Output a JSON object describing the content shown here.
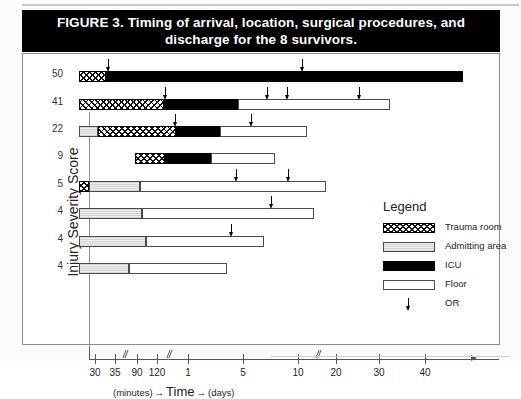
{
  "figure": {
    "title_line1": "FIGURE 3. Timing of arrival, location, surgical procedures, and",
    "title_line2": "discharge for the 8 survivors.",
    "ylabel": "Injury Severity Score",
    "xaxis_caption_minutes": "(minutes)",
    "xaxis_caption_time": "Time",
    "xaxis_caption_days": "(days)",
    "arrow_glyph": "→"
  },
  "legend": {
    "title": "Legend",
    "items": [
      {
        "label": "Trauma room",
        "kind": "trauma",
        "color": "#111111"
      },
      {
        "label": "Admitting area",
        "kind": "admit",
        "color": "#e3e3e3"
      },
      {
        "label": "ICU",
        "kind": "icu",
        "color": "#000000"
      },
      {
        "label": "Floor",
        "kind": "floor",
        "color": "#ffffff"
      },
      {
        "label": "OR",
        "kind": "arrow",
        "color": "#000000"
      }
    ]
  },
  "chart_data": {
    "type": "bar",
    "title": "FIGURE 3. Timing of arrival, location, surgical procedures, and discharge for the 8 survivors.",
    "xlabel": "Time (minutes → days)",
    "ylabel": "Injury Severity Score",
    "orientation": "horizontal-stacked-timeline",
    "grid": false,
    "legend_position": "right",
    "x_axis": {
      "units_left": "minutes",
      "units_right": "days",
      "break_marks": [
        true,
        true,
        true
      ],
      "ticks": [
        {
          "label": "30",
          "unit": "minutes",
          "px": 94
        },
        {
          "label": "35",
          "unit": "minutes",
          "px": 114
        },
        {
          "label": "90",
          "unit": "minutes",
          "px": 136
        },
        {
          "label": "120",
          "unit": "minutes",
          "px": 156
        },
        {
          "label": "1",
          "unit": "days",
          "px": 187
        },
        {
          "label": "5",
          "unit": "days",
          "px": 242
        },
        {
          "label": "10",
          "unit": "days",
          "px": 297
        },
        {
          "label": "20",
          "unit": "days",
          "px": 335
        },
        {
          "label": "30",
          "unit": "days",
          "px": 378
        },
        {
          "label": "40",
          "unit": "days",
          "px": 424
        }
      ]
    },
    "categories": [
      "50",
      "41",
      "22",
      "9",
      "5",
      "4",
      "4",
      "4"
    ],
    "patients": [
      {
        "iss": "50",
        "segments": [
          {
            "location": "Trauma room",
            "start_px": 78,
            "end_px": 105
          },
          {
            "location": "ICU",
            "start_px": 105,
            "end_px": 462
          }
        ],
        "or_marks_px": [
          107,
          301
        ]
      },
      {
        "iss": "41",
        "segments": [
          {
            "location": "Trauma room",
            "start_px": 78,
            "end_px": 163
          },
          {
            "location": "ICU",
            "start_px": 163,
            "end_px": 237
          },
          {
            "location": "Floor",
            "start_px": 237,
            "end_px": 389
          }
        ],
        "or_marks_px": [
          164,
          266,
          286,
          358
        ]
      },
      {
        "iss": "22",
        "segments": [
          {
            "location": "Admitting area",
            "start_px": 78,
            "end_px": 97
          },
          {
            "location": "Trauma room",
            "start_px": 97,
            "end_px": 175
          },
          {
            "location": "ICU",
            "start_px": 175,
            "end_px": 219
          },
          {
            "location": "Floor",
            "start_px": 219,
            "end_px": 306
          }
        ],
        "or_marks_px": [
          174,
          250
        ]
      },
      {
        "iss": "9",
        "segments": [
          {
            "location": "Trauma room",
            "start_px": 134,
            "end_px": 164
          },
          {
            "location": "ICU",
            "start_px": 164,
            "end_px": 210
          },
          {
            "location": "Floor",
            "start_px": 210,
            "end_px": 274
          }
        ],
        "or_marks_px": []
      },
      {
        "iss": "5",
        "segments": [
          {
            "location": "Trauma room",
            "start_px": 78,
            "end_px": 88
          },
          {
            "location": "Admitting area",
            "start_px": 88,
            "end_px": 139
          },
          {
            "location": "Floor",
            "start_px": 139,
            "end_px": 325
          }
        ],
        "or_marks_px": [
          235,
          287
        ]
      },
      {
        "iss": "4",
        "segments": [
          {
            "location": "Admitting area",
            "start_px": 78,
            "end_px": 141
          },
          {
            "location": "Floor",
            "start_px": 141,
            "end_px": 313
          }
        ],
        "or_marks_px": [
          270
        ]
      },
      {
        "iss": "4",
        "segments": [
          {
            "location": "Admitting area",
            "start_px": 78,
            "end_px": 145
          },
          {
            "location": "Floor",
            "start_px": 145,
            "end_px": 263
          }
        ],
        "or_marks_px": [
          230
        ]
      },
      {
        "iss": "4",
        "segments": [
          {
            "location": "Admitting area",
            "start_px": 78,
            "end_px": 128
          },
          {
            "location": "Floor",
            "start_px": 128,
            "end_px": 226
          }
        ],
        "or_marks_px": []
      }
    ]
  }
}
